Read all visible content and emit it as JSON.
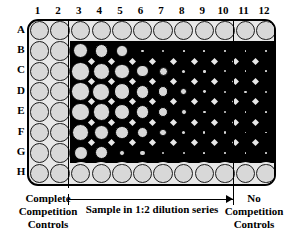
{
  "figure": {
    "plate": {
      "rows": [
        "A",
        "B",
        "C",
        "D",
        "E",
        "F",
        "G",
        "H"
      ],
      "columns": [
        "1",
        "2",
        "3",
        "4",
        "5",
        "6",
        "7",
        "8",
        "9",
        "10",
        "11",
        "12"
      ],
      "well_count": 96
    }
  },
  "captions": {
    "left": "Complete\nCompetition\nControls",
    "left_lines": [
      "Complete",
      "Competition",
      "Controls"
    ],
    "middle": "Sample in 1:2 dilution series",
    "right": "No\nCompetition\nControls",
    "right_lines": [
      "No",
      "Competition",
      "Controls"
    ]
  },
  "regions": {
    "complete_competition_columns": [
      "1",
      "2"
    ],
    "dilution_series_columns": [
      "3",
      "4",
      "5",
      "6",
      "7",
      "8",
      "9",
      "10"
    ],
    "no_competition_columns": [
      "11",
      "12"
    ]
  },
  "colors": {
    "plate_background": "#e8e8e8",
    "well_fill": "#d8d8d8",
    "well_outline": "#1a1a1a",
    "signal_dark": "#000000",
    "page_background": "#ffffff"
  },
  "well_map": {
    "note": "Relative well-spot diameter per row/column, 1.0 = full open well, 0 = fully quenched (black).",
    "rows": {
      "A": [
        1.0,
        1.0,
        1.0,
        1.0,
        1.0,
        1.0,
        1.0,
        1.0,
        1.0,
        1.0,
        1.0,
        1.0
      ],
      "B": [
        1.0,
        1.0,
        0.78,
        0.7,
        0.6,
        0.14,
        0.1,
        0.09,
        0.09,
        0.08,
        0.08,
        0.07
      ],
      "C": [
        1.0,
        1.0,
        0.95,
        0.88,
        0.8,
        0.62,
        0.46,
        0.16,
        0.13,
        0.11,
        0.1,
        0.09
      ],
      "D": [
        1.0,
        1.0,
        0.95,
        0.92,
        0.86,
        0.72,
        0.55,
        0.34,
        0.15,
        0.12,
        0.11,
        0.1
      ],
      "E": [
        1.0,
        1.0,
        0.95,
        0.9,
        0.84,
        0.7,
        0.52,
        0.3,
        0.14,
        0.12,
        0.1,
        0.09
      ],
      "F": [
        1.0,
        1.0,
        0.9,
        0.8,
        0.72,
        0.58,
        0.4,
        0.18,
        0.12,
        0.11,
        0.1,
        0.09
      ],
      "G": [
        1.0,
        1.0,
        0.74,
        0.66,
        0.3,
        0.22,
        0.12,
        0.1,
        0.09,
        0.08,
        0.08,
        0.07
      ],
      "H": [
        1.0,
        1.0,
        1.0,
        1.0,
        1.0,
        1.0,
        1.0,
        1.0,
        1.0,
        1.0,
        1.0,
        1.0
      ]
    },
    "dark_background_rows": [
      "B",
      "C",
      "D",
      "E",
      "F",
      "G"
    ],
    "dark_background_start_column": "3"
  }
}
